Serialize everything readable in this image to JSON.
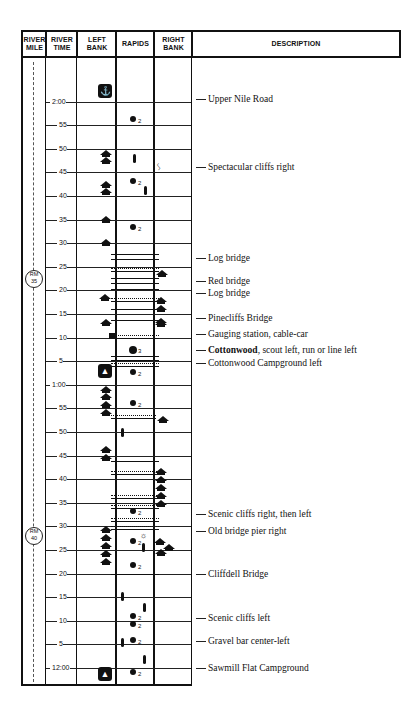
{
  "header": {
    "river_mile": "RIVER MILE",
    "river_time": "RIVER TIME",
    "left_bank": "LEFT BANK",
    "rapids": "RAPIDS",
    "right_bank": "RIGHT BANK",
    "description": "DESCRIPTION"
  },
  "river_miles": [
    {
      "label": "RM 35",
      "y": 278
    },
    {
      "label": "RM 40",
      "y": 535
    }
  ],
  "time_ticks": [
    {
      "label": "2:00",
      "y": 102
    },
    {
      "label": "55",
      "y": 125
    },
    {
      "label": "50",
      "y": 149
    },
    {
      "label": "45",
      "y": 172
    },
    {
      "label": "40",
      "y": 196
    },
    {
      "label": "35",
      "y": 220
    },
    {
      "label": "30",
      "y": 243
    },
    {
      "label": "25",
      "y": 267
    },
    {
      "label": "20",
      "y": 290
    },
    {
      "label": "15",
      "y": 314
    },
    {
      "label": "10",
      "y": 338
    },
    {
      "label": "5",
      "y": 361
    },
    {
      "label": "1:00",
      "y": 385
    },
    {
      "label": "55",
      "y": 408
    },
    {
      "label": "50",
      "y": 432
    },
    {
      "label": "45",
      "y": 456
    },
    {
      "label": "40",
      "y": 479
    },
    {
      "label": "35",
      "y": 503
    },
    {
      "label": "30",
      "y": 526
    },
    {
      "label": "25",
      "y": 550
    },
    {
      "label": "20",
      "y": 574
    },
    {
      "label": "15",
      "y": 597
    },
    {
      "label": "10",
      "y": 621
    },
    {
      "label": "5",
      "y": 644
    },
    {
      "label": "12:00",
      "y": 668
    }
  ],
  "descriptions": [
    {
      "text": "Upper Nile Road",
      "y": 100
    },
    {
      "text": "Spectacular cliffs right",
      "y": 168
    },
    {
      "text": "Log bridge",
      "y": 259
    },
    {
      "text": "Red bridge",
      "y": 282
    },
    {
      "text": "Log bridge",
      "y": 294
    },
    {
      "text": "Pinecliffs Bridge",
      "y": 319
    },
    {
      "text": "Gauging station, cable-car",
      "y": 335
    },
    {
      "bold": "Cottonwood",
      "text": ", scout left, run or line left",
      "y": 351
    },
    {
      "text": "Cottonwood Campground left",
      "y": 364
    },
    {
      "text": "Scenic cliffs right, then left",
      "y": 515
    },
    {
      "text": "Old bridge pier right",
      "y": 532
    },
    {
      "text": "Cliffdell Bridge",
      "y": 575
    },
    {
      "text": "Scenic cliffs left",
      "y": 619
    },
    {
      "text": "Gravel bar center-left",
      "y": 642
    },
    {
      "text": "Sawmill Flat Campground",
      "y": 669
    }
  ],
  "rapids": [
    {
      "class": 2,
      "y": 120
    },
    {
      "class": 2,
      "y": 182
    },
    {
      "class": 2,
      "y": 228
    },
    {
      "class": 3,
      "y": 350
    },
    {
      "class": 2,
      "y": 373
    },
    {
      "class": 2,
      "y": 404
    },
    {
      "class": 2,
      "y": 512
    },
    {
      "class": 2,
      "y": 542
    },
    {
      "class": 2,
      "y": 566
    },
    {
      "class": 2,
      "y": 617
    },
    {
      "class": 2,
      "y": 625
    },
    {
      "class": 2,
      "y": 641
    },
    {
      "class": 2,
      "y": 673
    }
  ],
  "icons": {
    "anchor": "⚓",
    "campground": "▲"
  }
}
